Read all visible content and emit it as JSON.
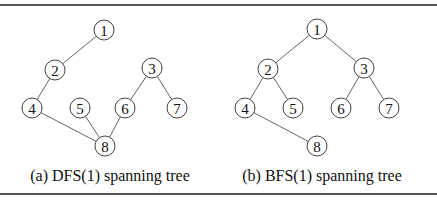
{
  "figures": [
    {
      "id": "dfs",
      "caption": "(a) DFS(1) spanning tree",
      "nodes": [
        "1",
        "2",
        "3",
        "4",
        "5",
        "6",
        "7",
        "8"
      ],
      "edges": [
        [
          "1",
          "2"
        ],
        [
          "2",
          "4"
        ],
        [
          "4",
          "8"
        ],
        [
          "5",
          "8"
        ],
        [
          "6",
          "8"
        ],
        [
          "3",
          "6"
        ],
        [
          "3",
          "7"
        ]
      ]
    },
    {
      "id": "bfs",
      "caption": "(b) BFS(1) spanning tree",
      "nodes": [
        "1",
        "2",
        "3",
        "4",
        "5",
        "6",
        "7",
        "8"
      ],
      "edges": [
        [
          "1",
          "2"
        ],
        [
          "1",
          "3"
        ],
        [
          "2",
          "4"
        ],
        [
          "2",
          "5"
        ],
        [
          "3",
          "6"
        ],
        [
          "3",
          "7"
        ],
        [
          "4",
          "8"
        ]
      ]
    }
  ]
}
